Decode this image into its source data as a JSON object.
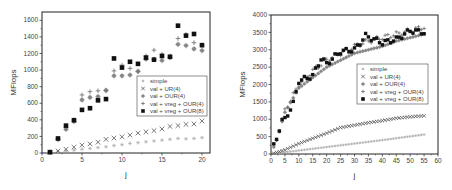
{
  "chart_data": [
    {
      "type": "scatter",
      "title": "",
      "xlabel": "j",
      "ylabel": "MFlops",
      "xlim": [
        0,
        21
      ],
      "ylim": [
        0,
        1700
      ],
      "xticks": [
        0,
        5,
        10,
        15,
        20
      ],
      "yticks": [
        0,
        200,
        400,
        600,
        800,
        1000,
        1200,
        1400,
        1600
      ],
      "grid": false,
      "legend_position": "center-right",
      "frame": {
        "x0": 42,
        "y0": 12,
        "x1": 210,
        "y1": 153
      },
      "legend_box": {
        "x": 137,
        "y": 76,
        "w": 70,
        "h": 40
      },
      "x": [
        1,
        2,
        3,
        4,
        5,
        6,
        7,
        8,
        9,
        10,
        11,
        12,
        13,
        14,
        15,
        16,
        17,
        18,
        19,
        20
      ],
      "series": [
        {
          "name": "simple",
          "marker": "star",
          "color": "#aaaaaa",
          "values": [
            5,
            15,
            25,
            35,
            45,
            55,
            65,
            75,
            90,
            100,
            115,
            125,
            135,
            145,
            155,
            165,
            175,
            170,
            175,
            185
          ]
        },
        {
          "name": "val + UR(4)",
          "marker": "x",
          "color": "#555555",
          "values": [
            10,
            25,
            45,
            70,
            95,
            110,
            130,
            165,
            180,
            195,
            215,
            240,
            255,
            270,
            290,
            320,
            330,
            345,
            350,
            385
          ]
        },
        {
          "name": "val + OUR(4)",
          "marker": "circle",
          "color": "#888888",
          "values": [
            10,
            165,
            285,
            380,
            640,
            670,
            680,
            755,
            930,
            930,
            940,
            985,
            1130,
            1130,
            1115,
            1150,
            1310,
            1295,
            1255,
            1235
          ]
        },
        {
          "name": "val + vreg + OUR(4)",
          "marker": "plus",
          "color": "#777777",
          "values": [
            10,
            170,
            310,
            400,
            700,
            740,
            750,
            755,
            990,
            1060,
            1020,
            980,
            1170,
            1240,
            1190,
            1170,
            1380,
            1430,
            1330,
            1300
          ]
        },
        {
          "name": "val + vreg + OUR(8)",
          "marker": "square",
          "color": "#111111",
          "values": [
            10,
            175,
            330,
            395,
            520,
            540,
            635,
            650,
            1140,
            1030,
            1100,
            1075,
            1150,
            1125,
            1170,
            1160,
            1535,
            1415,
            1435,
            1300
          ]
        }
      ]
    },
    {
      "type": "scatter",
      "title": "",
      "xlabel": "j",
      "ylabel": "MFlops",
      "xlim": [
        0,
        60
      ],
      "ylim": [
        0,
        4000
      ],
      "xticks": [
        0,
        5,
        10,
        15,
        20,
        25,
        30,
        35,
        40,
        45,
        50,
        55,
        60
      ],
      "yticks": [
        0,
        500,
        1000,
        1500,
        2000,
        2500,
        3000,
        3500,
        4000
      ],
      "grid": false,
      "legend_position": "center-right",
      "frame": {
        "x0": 271,
        "y0": 15,
        "x1": 438,
        "y1": 154
      },
      "legend_box": {
        "x": 357,
        "y": 64,
        "w": 71,
        "h": 40
      },
      "x_range": [
        1,
        55
      ],
      "series": [
        {
          "name": "simple",
          "marker": "star",
          "color": "#aaaaaa",
          "model": "linear",
          "values_sampled": {
            "1": 10,
            "10": 100,
            "20": 200,
            "30": 300,
            "40": 400,
            "55": 560
          }
        },
        {
          "name": "val + UR(4)",
          "marker": "x",
          "color": "#555555",
          "model": "saturating",
          "values_sampled": {
            "1": 20,
            "5": 120,
            "10": 300,
            "15": 450,
            "20": 600,
            "25": 760,
            "30": 830,
            "35": 900,
            "40": 960,
            "45": 1030,
            "50": 1070,
            "55": 1100
          }
        },
        {
          "name": "val + OUR(4)",
          "marker": "circle",
          "color": "#888888",
          "model": "saturating",
          "values_sampled": {
            "2": 400,
            "5": 1200,
            "10": 1900,
            "15": 2200,
            "20": 2500,
            "25": 2700,
            "30": 2900,
            "35": 3000,
            "40": 3100,
            "45": 3250,
            "50": 3350,
            "55": 3450
          }
        },
        {
          "name": "val + vreg + OUR(4)",
          "marker": "plus",
          "color": "#777777",
          "model": "saturating",
          "values_sampled": {
            "2": 420,
            "5": 1250,
            "10": 2000,
            "15": 2400,
            "20": 2700,
            "25": 2900,
            "30": 3100,
            "35": 3250,
            "40": 3350,
            "45": 3450,
            "50": 3550,
            "55": 3650
          }
        },
        {
          "name": "val + vreg + OUR(8)",
          "marker": "square",
          "color": "#111111",
          "model": "saturating",
          "values_sampled": {
            "2": 450,
            "3": 720,
            "4": 950,
            "5": 1000,
            "8": 1450,
            "10": 2100,
            "15": 2250,
            "18": 2750,
            "20": 2600,
            "25": 2950,
            "30": 3000,
            "34": 3400,
            "40": 3200,
            "45": 3300,
            "50": 3550,
            "55": 3500
          }
        }
      ]
    }
  ]
}
